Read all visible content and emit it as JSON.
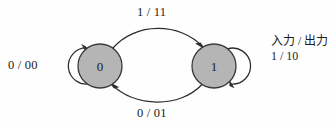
{
  "diagram": {
    "type": "state-transition-diagram",
    "background_color": "#fefefe",
    "node_fill_color": "#b5b5b5",
    "node_stroke_color": "#3a3a3a",
    "edge_color": "#2b2b2b",
    "states": [
      {
        "id": "state-0",
        "label": "0",
        "cx": 100,
        "cy": 66,
        "r": 22
      },
      {
        "id": "state-1",
        "label": "1",
        "cx": 214,
        "cy": 66,
        "r": 22
      }
    ],
    "transitions": [
      {
        "id": "self-loop-0",
        "from": "state-0",
        "to": "state-0",
        "input": "0",
        "output": "00",
        "label": "0 / 00",
        "label_x": 8,
        "label_y": 58,
        "kind": "self-loop",
        "side": "left"
      },
      {
        "id": "arc-0-to-1",
        "from": "state-0",
        "to": "state-1",
        "input": "1",
        "output": "11",
        "label": "1 / 11",
        "label_x": 137,
        "label_y": 5,
        "kind": "arc",
        "side": "top"
      },
      {
        "id": "arc-1-to-0",
        "from": "state-1",
        "to": "state-0",
        "input": "0",
        "output": "01",
        "label": "0 / 01",
        "label_x": 137,
        "label_y": 106,
        "kind": "arc",
        "side": "bottom"
      },
      {
        "id": "self-loop-1",
        "from": "state-1",
        "to": "state-1",
        "input": "1",
        "output": "10",
        "label": "1 / 10",
        "label_x": 271,
        "label_y": 51,
        "kind": "self-loop",
        "side": "right"
      }
    ],
    "legend": {
      "id": "legend-input-output",
      "line1": "入力 / 出力",
      "line2": "1 / 10",
      "x": 271,
      "y": 34
    }
  }
}
